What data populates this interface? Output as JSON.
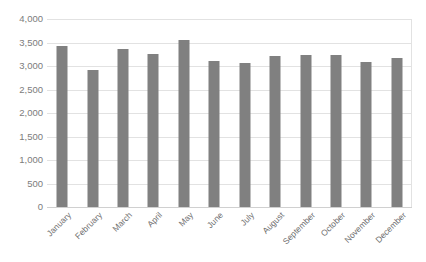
{
  "chart_data": {
    "type": "bar",
    "title": "",
    "xlabel": "",
    "ylabel": "",
    "ylim": [
      0,
      4000
    ],
    "grid": true,
    "legend": "none",
    "categories": [
      "January",
      "February",
      "March",
      "April",
      "May",
      "June",
      "July",
      "August",
      "September",
      "October",
      "November",
      "December"
    ],
    "values": [
      3430,
      2925,
      3355,
      3265,
      3555,
      3105,
      3060,
      3210,
      3225,
      3230,
      3085,
      3180
    ],
    "ytick_labels": [
      "4,000",
      "3,500",
      "3,000",
      "2,500",
      "2,000",
      "1,500",
      "1,000",
      "500",
      "0"
    ],
    "ytick_values": [
      4000,
      3500,
      3000,
      2500,
      2000,
      1500,
      1000,
      500,
      0
    ],
    "series": [
      {
        "name": "Series 1",
        "color": "#808080",
        "values": [
          3430,
          2925,
          3355,
          3265,
          3555,
          3105,
          3060,
          3210,
          3225,
          3230,
          3085,
          3180
        ]
      }
    ]
  },
  "style": {
    "bar_color": "#808080",
    "gridline_color": "#e2e2e2",
    "axis_text_color": "#7c7c7c",
    "background": "#ffffff"
  }
}
